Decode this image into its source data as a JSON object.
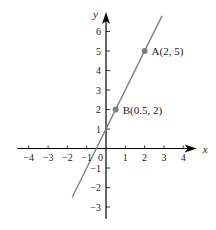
{
  "chart_data": {
    "type": "line",
    "title": "",
    "xlabel": "x",
    "ylabel": "y",
    "xlim": [
      -4.6,
      4.7
    ],
    "ylim": [
      -3.6,
      7.0
    ],
    "grid": false,
    "x_ticks": [
      -4,
      -3,
      -2,
      -1,
      1,
      2,
      3,
      4
    ],
    "y_ticks": [
      -3,
      -2,
      -1,
      1,
      2,
      3,
      4,
      5,
      6
    ],
    "origin_label": "0",
    "series": [
      {
        "name": "line",
        "equation": "y = 2x + 1",
        "x": [
          -1.75,
          2.9
        ],
        "y": [
          -2.5,
          6.8
        ],
        "color": "#808080"
      }
    ],
    "points": [
      {
        "name": "A",
        "x": 2,
        "y": 5,
        "label": "A(2, 5)",
        "color": "#808080"
      },
      {
        "name": "B",
        "x": 0.5,
        "y": 2,
        "label": "B(0.5, 2)",
        "color": "#808080"
      }
    ]
  },
  "style": {
    "axis_color": "#000000",
    "line_color": "#808080",
    "text_color": "#222222"
  }
}
